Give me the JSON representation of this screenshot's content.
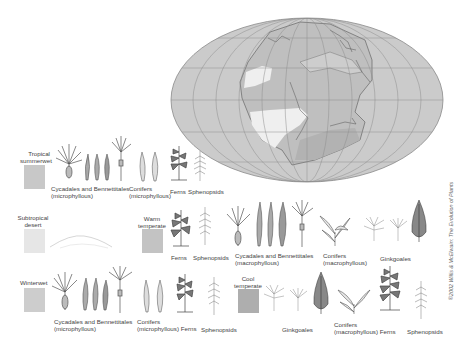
{
  "map": {
    "projection": "mollweide-ellipse",
    "ocean_color": "#c9c9c9",
    "land_color": "#bdbdbd",
    "desert_color": "#eeeeee",
    "grid_color": "#8f8f8f",
    "coast_color": "#555555"
  },
  "climate_zones": [
    {
      "id": "tropical-summerwet",
      "label": "Tropical summerwet",
      "swatch_color": "#c8c8c8",
      "plant_groups": [
        {
          "label": "Cycadales and Bennettitales (microphyllous)"
        },
        {
          "label": "Conifers (microphyllous)"
        },
        {
          "label": "Ferns"
        },
        {
          "label": "Sphenopsids"
        }
      ]
    },
    {
      "id": "subtropical-desert",
      "label": "Subtropical desert",
      "swatch_color": "#e6e6e6",
      "plant_groups": []
    },
    {
      "id": "warm-temperate",
      "label": "Warm temperate",
      "swatch_color": "#c3c3c3",
      "plant_groups": [
        {
          "label": "Ferns"
        },
        {
          "label": "Sphenopsids"
        },
        {
          "label": "Cycadales and Bennettitales (macrophyllous)"
        },
        {
          "label": "Conifers (macrophyllous)"
        },
        {
          "label": "Ginkgoales"
        }
      ]
    },
    {
      "id": "winterwet",
      "label": "Winterwet",
      "swatch_color": "#cdcdcd",
      "plant_groups": [
        {
          "label": "Cycadales and Bennettitales (microphyllous)"
        },
        {
          "label": "Conifers (microphyllous)"
        },
        {
          "label": "Ferns"
        },
        {
          "label": "Sphenopsids"
        }
      ]
    },
    {
      "id": "cool-temperate",
      "label": "Cool temperate",
      "swatch_color": "#aeaeae",
      "plant_groups": [
        {
          "label": "Ginkgoales"
        },
        {
          "label": "Conifers (macrophyllous)"
        },
        {
          "label": "Ferns"
        },
        {
          "label": "Sphenopsids"
        }
      ]
    }
  ],
  "labels": {
    "tropical_l1": "Tropical",
    "tropical_l2": "summerwet",
    "subtrop_l1": "Subtropical",
    "subtrop_l2": "desert",
    "warm_l1": "Warm",
    "warm_l2": "temperate",
    "winter_l1": "Winterwet",
    "cool_l1": "Cool",
    "cool_l2": "temperate",
    "cyc_l1": "Cycadales and Bennettitales",
    "cyc_micro_l2": "(microphyllous)",
    "cyc_macro_l2": "(macrophyllous)",
    "conifers": "Conifers",
    "conifers_micro": "(microphyllous)",
    "conifers_macro": "(macrophyllous)",
    "conifers_micro_ferns": "(microphyllous)  Ferns",
    "conifers_macro_ferns": "(macrophyllous)  Ferns",
    "ferns": "Ferns",
    "sphenopsids": "Sphenopsids",
    "ginkgoales": "Ginkgoales"
  },
  "copyright": "©2002 Willis & McElwain: The Evolution of Plants"
}
